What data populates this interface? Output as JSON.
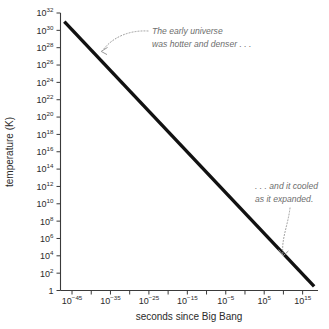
{
  "chart_data": {
    "type": "line",
    "title": "",
    "subtitle": "",
    "xlabel": "seconds since Big Bang",
    "ylabel": "temperature (K)",
    "xscale": "log",
    "yscale": "log",
    "xlim": [
      1e-48,
      1e+19
    ],
    "ylim": [
      1,
      1e+32
    ],
    "grid": false,
    "legend": null,
    "x_tick_labels": [
      {
        "base": "10",
        "exp": "−45",
        "value": 1e-45
      },
      {
        "base": "10",
        "exp": "−35",
        "value": 1e-35
      },
      {
        "base": "10",
        "exp": "−25",
        "value": 1e-25
      },
      {
        "base": "10",
        "exp": "−15",
        "value": 1e-15
      },
      {
        "base": "10",
        "exp": "−5",
        "value": 1e-05
      },
      {
        "base": "10",
        "exp": "5",
        "value": 100000
      },
      {
        "base": "10",
        "exp": "15",
        "value": 1000000000000000
      }
    ],
    "y_tick_labels": [
      {
        "base": "10",
        "exp": "32",
        "value": 1e+32
      },
      {
        "base": "10",
        "exp": "30",
        "value": 1e+30
      },
      {
        "base": "10",
        "exp": "28",
        "value": 1e+28
      },
      {
        "base": "10",
        "exp": "26",
        "value": 1e+26
      },
      {
        "base": "10",
        "exp": "24",
        "value": 1e+24
      },
      {
        "base": "10",
        "exp": "22",
        "value": 1e+22
      },
      {
        "base": "10",
        "exp": "20",
        "value": 1e+20
      },
      {
        "base": "10",
        "exp": "18",
        "value": 1e+18
      },
      {
        "base": "10",
        "exp": "16",
        "value": 1e+16
      },
      {
        "base": "10",
        "exp": "14",
        "value": 100000000000000.0
      },
      {
        "base": "10",
        "exp": "12",
        "value": 1000000000000.0
      },
      {
        "base": "10",
        "exp": "10",
        "value": 10000000000.0
      },
      {
        "base": "10",
        "exp": "8",
        "value": 100000000
      },
      {
        "base": "10",
        "exp": "6",
        "value": 1000000
      },
      {
        "base": "10",
        "exp": "4",
        "value": 10000
      },
      {
        "base": "10",
        "exp": "2",
        "value": 100
      },
      {
        "base": "1",
        "exp": "",
        "value": 1
      }
    ],
    "series": [
      {
        "name": "temperature of the universe",
        "points": [
          {
            "x": 1e-47,
            "y": 1e+31
          },
          {
            "x": 1e+18,
            "y": 3
          }
        ]
      }
    ],
    "annotations": [
      {
        "id": "early-universe",
        "lines": [
          "The early universe",
          "was hotter and denser . . ."
        ],
        "points_to": {
          "x": 1e-37,
          "y": 3.2e+26
        }
      },
      {
        "id": "cooled-expanded",
        "lines": [
          ". . . and it cooled",
          "as it expanded."
        ],
        "points_to": {
          "x": 20000000000.0,
          "y": 4000.0
        }
      }
    ]
  },
  "figure": {
    "background_color": "#ffffff",
    "line_color": "#111111",
    "axis_color": "#3a3a3a",
    "annotation_color": "#6d6d6d"
  }
}
